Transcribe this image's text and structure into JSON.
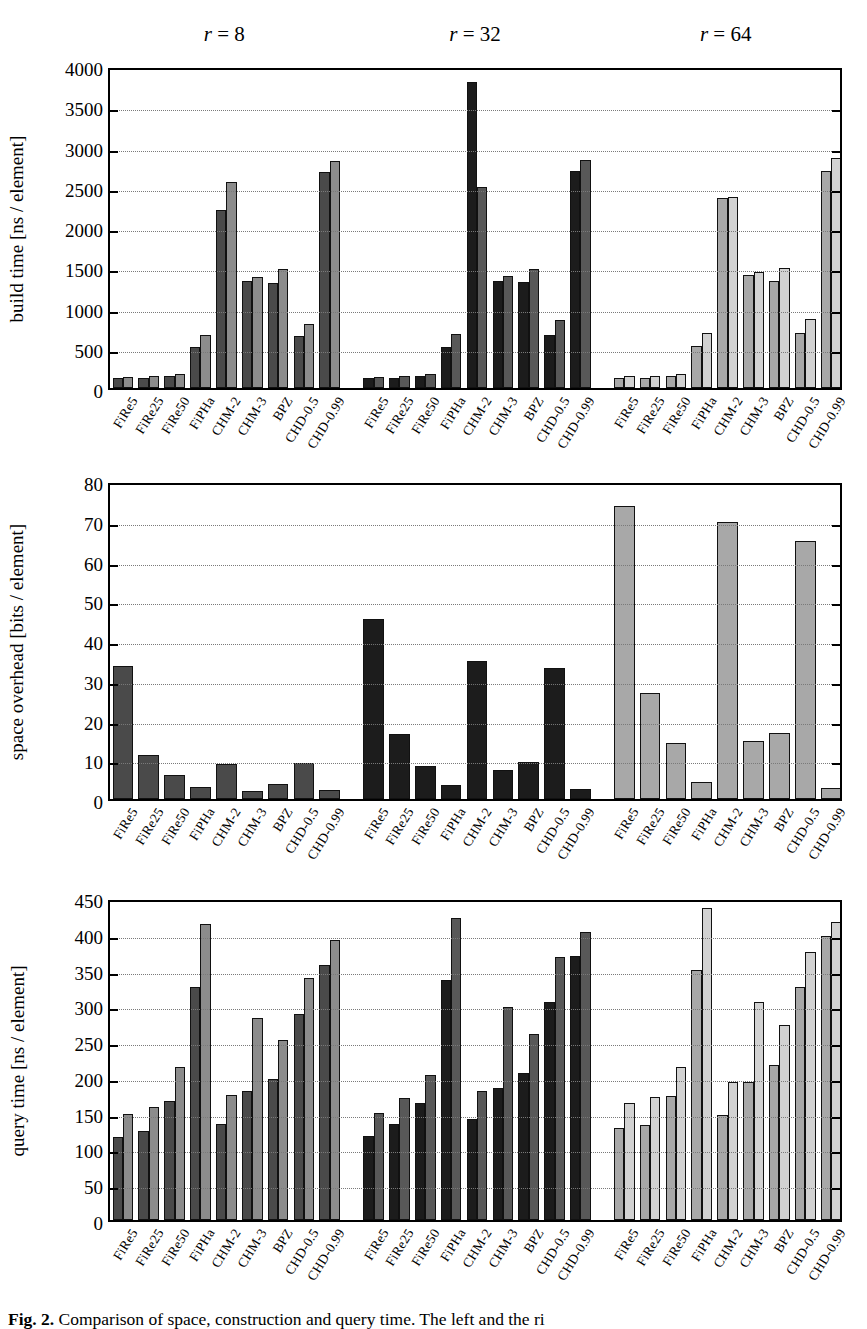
{
  "figure": {
    "caption_label": "Fig. 2.",
    "caption_text": "Comparison of space, construction and query time. The left and the ri"
  },
  "groups": [
    {
      "id": "r8",
      "label_var": "r",
      "label_eq": " = ",
      "label_val": "8"
    },
    {
      "id": "r32",
      "label_var": "r",
      "label_eq": " = ",
      "label_val": "32"
    },
    {
      "id": "r64",
      "label_var": "r",
      "label_eq": " = ",
      "label_val": "64"
    }
  ],
  "categories": [
    "FiRe5",
    "FiRe25",
    "FiRe50",
    "FiPHa",
    "CHM-2",
    "CHM-3",
    "BPZ",
    "CHD-0.5",
    "CHD-0.99"
  ],
  "colors": {
    "r8_dark": "#4a4a4a",
    "r8_light": "#8c8c8c",
    "r32_dark": "#1c1c1c",
    "r32_light": "#585858",
    "r64_dark": "#a8a8a8",
    "r64_light": "#d2d2d2",
    "axis": "#000000",
    "grid": "#7a7a7a"
  },
  "chart_data": [
    {
      "type": "bar",
      "id": "build-time",
      "title": "",
      "xlabel": "",
      "ylabel": "build time [ns / element]",
      "ylim": [
        0,
        4000
      ],
      "yticks": [
        0,
        500,
        1000,
        1500,
        2000,
        2500,
        3000,
        3500,
        4000
      ],
      "grid": true,
      "legend": "none",
      "categories": [
        "FiRe5",
        "FiRe25",
        "FiRe50",
        "FiPHa",
        "CHM-2",
        "CHM-3",
        "BPZ",
        "CHD-0.5",
        "CHD-0.99"
      ],
      "groups": [
        {
          "name": "r = 8",
          "series": [
            {
              "name": "first",
              "values": [
                125,
                130,
                150,
                510,
                2215,
                1335,
                1310,
                640,
                2680
              ]
            },
            {
              "name": "second",
              "values": [
                140,
                150,
                180,
                660,
                2565,
                1385,
                1475,
                800,
                2820
              ]
            }
          ]
        },
        {
          "name": "r = 32",
          "series": [
            {
              "name": "first",
              "values": [
                125,
                130,
                150,
                515,
                3805,
                1330,
                1320,
                660,
                2690
              ]
            },
            {
              "name": "second",
              "values": [
                140,
                155,
                180,
                675,
                2495,
                1390,
                1480,
                840,
                2835
              ]
            }
          ]
        },
        {
          "name": "r = 64",
          "series": [
            {
              "name": "first",
              "values": [
                120,
                130,
                150,
                525,
                2355,
                1405,
                1330,
                685,
                2700
              ]
            },
            {
              "name": "second",
              "values": [
                145,
                155,
                180,
                680,
                2370,
                1440,
                1485,
                860,
                2855
              ]
            }
          ]
        }
      ]
    },
    {
      "type": "bar",
      "id": "space-overhead",
      "title": "",
      "xlabel": "",
      "ylabel": "space overhead [bits / element]",
      "ylim": [
        0,
        80
      ],
      "yticks": [
        0,
        10,
        20,
        30,
        40,
        50,
        60,
        70,
        80
      ],
      "grid": true,
      "legend": "none",
      "categories": [
        "FiRe5",
        "FiRe25",
        "FiRe50",
        "FiPHa",
        "CHM-2",
        "CHM-3",
        "BPZ",
        "CHD-0.5",
        "CHD-0.99"
      ],
      "groups": [
        {
          "name": "r = 8",
          "series": [
            {
              "name": "value",
              "values": [
                33.5,
                11.0,
                6.0,
                3.0,
                8.9,
                1.9,
                3.9,
                9.1,
                2.2
              ]
            }
          ]
        },
        {
          "name": "r = 32",
          "series": [
            {
              "name": "value",
              "values": [
                45.4,
                16.4,
                8.2,
                3.6,
                34.8,
                7.4,
                9.4,
                33.0,
                2.4
              ]
            }
          ]
        },
        {
          "name": "r = 64",
          "series": [
            {
              "name": "value",
              "values": [
                73.8,
                26.7,
                14.1,
                4.2,
                69.7,
                14.7,
                16.6,
                65.0,
                2.8
              ]
            }
          ]
        }
      ]
    },
    {
      "type": "bar",
      "id": "query-time",
      "title": "",
      "xlabel": "",
      "ylabel": "query time [ns / element]",
      "ylim": [
        0,
        450
      ],
      "yticks": [
        0,
        50,
        100,
        150,
        200,
        250,
        300,
        350,
        400,
        450
      ],
      "grid": true,
      "legend": "none",
      "categories": [
        "FiRe5",
        "FiRe25",
        "FiRe50",
        "FiPHa",
        "CHM-2",
        "CHM-3",
        "BPZ",
        "CHD-0.5",
        "CHD-0.99"
      ],
      "groups": [
        {
          "name": "r = 8",
          "series": [
            {
              "name": "first",
              "values": [
                116,
                124,
                167,
                326,
                134,
                180,
                197,
                288,
                357
              ]
            },
            {
              "name": "second",
              "values": [
                148,
                158,
                214,
                413,
                175,
                283,
                252,
                338,
                392
              ]
            }
          ]
        },
        {
          "name": "r = 32",
          "series": [
            {
              "name": "first",
              "values": [
                117,
                134,
                164,
                336,
                141,
                185,
                205,
                305,
                369
              ]
            },
            {
              "name": "second",
              "values": [
                150,
                170,
                203,
                422,
                181,
                298,
                260,
                368,
                403
              ]
            }
          ]
        },
        {
          "name": "r = 64",
          "series": [
            {
              "name": "first",
              "values": [
                128,
                133,
                174,
                350,
                147,
                193,
                217,
                325,
                397
              ]
            },
            {
              "name": "second",
              "values": [
                163,
                172,
                214,
                436,
                193,
                304,
                272,
                375,
                417
              ]
            }
          ]
        }
      ]
    }
  ]
}
